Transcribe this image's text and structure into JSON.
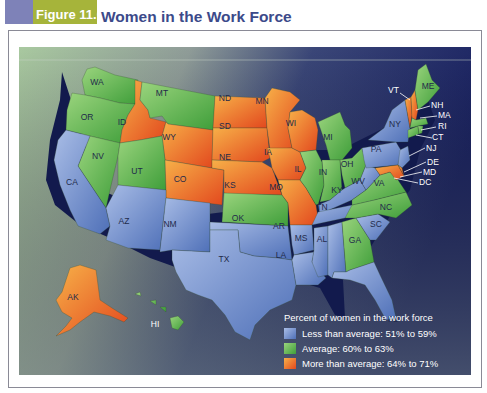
{
  "header": {
    "figure_label": "Figure 11.6",
    "title": "Women in the Work Force"
  },
  "colors": {
    "header_block": "#7e82b8",
    "figure_label_bg": "#a6b43a",
    "title_text": "#3c4a8a",
    "less_than_average": "#6f8fce",
    "average": "#6cbf4e",
    "more_than_average": "#f08a2c",
    "ocean_dark": "#1c2466"
  },
  "legend": {
    "title": "Percent of women in the work force",
    "items": [
      {
        "category": "less",
        "label": "Less than average: 51% to 59%"
      },
      {
        "category": "average",
        "label": "Average: 60% to 63%"
      },
      {
        "category": "more",
        "label": "More than average: 64% to 71%"
      }
    ]
  },
  "states": {
    "WA": "average",
    "OR": "average",
    "ID": "more",
    "MT": "average",
    "WY": "more",
    "ND": "more",
    "SD": "more",
    "NE": "more",
    "MN": "more",
    "IA": "more",
    "WI": "more",
    "MO": "more",
    "CO": "more",
    "AK": "more",
    "VT": "more",
    "NH": "more",
    "MD": "more",
    "DE": "more",
    "NV": "average",
    "UT": "average",
    "KS": "average",
    "IL": "average",
    "MI": "average",
    "IN": "average",
    "OH": "average",
    "VA": "average",
    "NC": "average",
    "GA": "average",
    "ME": "average",
    "MA": "average",
    "RI": "average",
    "CT": "average",
    "HI": "average",
    "CA": "less",
    "AZ": "less",
    "NM": "less",
    "TX": "less",
    "OK": "less",
    "AR": "less",
    "LA": "less",
    "MS": "less",
    "AL": "less",
    "TN": "less",
    "KY": "less",
    "WV": "less",
    "SC": "less",
    "FL": "less",
    "PA": "less",
    "NY": "less",
    "NJ": "less",
    "DC": "less"
  },
  "labels": {
    "WA": "WA",
    "OR": "OR",
    "ID": "ID",
    "MT": "MT",
    "WY": "WY",
    "ND": "ND",
    "SD": "SD",
    "NE": "NE",
    "MN": "MN",
    "IA": "IA",
    "WI": "WI",
    "MO": "MO",
    "CO": "CO",
    "AK": "AK",
    "NV": "NV",
    "UT": "UT",
    "KS": "KS",
    "IL": "IL",
    "MI": "MI",
    "IN": "IN",
    "OH": "OH",
    "VA": "VA",
    "NC": "NC",
    "GA": "GA",
    "ME": "ME",
    "HI": "HI",
    "CA": "CA",
    "AZ": "AZ",
    "NM": "NM",
    "TX": "TX",
    "OK": "OK",
    "AR": "AR",
    "LA": "LA",
    "MS": "MS",
    "AL": "AL",
    "TN": "TN",
    "KY": "KY",
    "WV": "WV",
    "SC": "SC",
    "FL": "FL",
    "PA": "PA",
    "NY": "NY",
    "VT": "VT",
    "NH": "NH",
    "MA": "MA",
    "RI": "RI",
    "CT": "CT",
    "NJ": "NJ",
    "DE": "DE",
    "MD": "MD",
    "DC": "DC"
  }
}
